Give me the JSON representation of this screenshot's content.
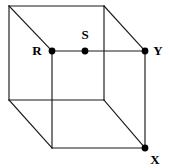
{
  "figure": {
    "type": "geometric-diagram",
    "shape": "cube",
    "background_color": "#ffffff",
    "line_color": "#1a1a1a",
    "point_color": "#000000",
    "canvas": {
      "width": 169,
      "height": 168
    }
  },
  "labels": {
    "r": "R",
    "s": "S",
    "y": "Y",
    "x": "X"
  },
  "points": [
    {
      "id": "r",
      "label": "R",
      "cx": 52,
      "cy": 51,
      "label_x": 37,
      "label_y": 52,
      "anchor": "middle"
    },
    {
      "id": "s",
      "label": "S",
      "cx": 85,
      "cy": 51,
      "label_x": 85,
      "label_y": 36,
      "anchor": "middle"
    },
    {
      "id": "y",
      "label": "Y",
      "cx": 145,
      "cy": 51,
      "label_x": 158,
      "label_y": 52,
      "anchor": "middle"
    },
    {
      "id": "x",
      "label": "X",
      "cx": 145,
      "cy": 148,
      "label_x": 155,
      "label_y": 161,
      "anchor": "middle"
    }
  ],
  "vertices": {
    "back_top_left": {
      "x": 9,
      "y": 6
    },
    "back_top_right": {
      "x": 104,
      "y": 6
    },
    "back_bottom_right": {
      "x": 104,
      "y": 100
    },
    "back_bottom_left": {
      "x": 9,
      "y": 100
    },
    "front_top_left": {
      "x": 52,
      "y": 51
    },
    "front_top_right": {
      "x": 145,
      "y": 51
    },
    "front_bottom_right": {
      "x": 145,
      "y": 148
    },
    "front_bottom_left": {
      "x": 52,
      "y": 148
    }
  },
  "edges": [
    {
      "name": "back-top",
      "x1": 9,
      "y1": 6,
      "x2": 104,
      "y2": 6
    },
    {
      "name": "back-right",
      "x1": 104,
      "y1": 6,
      "x2": 104,
      "y2": 100
    },
    {
      "name": "back-bottom",
      "x1": 9,
      "y1": 100,
      "x2": 104,
      "y2": 100
    },
    {
      "name": "back-left",
      "x1": 9,
      "y1": 6,
      "x2": 9,
      "y2": 100
    },
    {
      "name": "front-top",
      "x1": 52,
      "y1": 51,
      "x2": 145,
      "y2": 51
    },
    {
      "name": "front-right",
      "x1": 145,
      "y1": 51,
      "x2": 145,
      "y2": 148
    },
    {
      "name": "front-bottom",
      "x1": 52,
      "y1": 148,
      "x2": 145,
      "y2": 148
    },
    {
      "name": "front-left",
      "x1": 52,
      "y1": 51,
      "x2": 52,
      "y2": 148
    },
    {
      "name": "connector-top-left",
      "x1": 9,
      "y1": 6,
      "x2": 52,
      "y2": 51
    },
    {
      "name": "connector-top-right",
      "x1": 104,
      "y1": 6,
      "x2": 145,
      "y2": 51
    },
    {
      "name": "connector-bottom-right",
      "x1": 104,
      "y1": 100,
      "x2": 145,
      "y2": 148
    },
    {
      "name": "connector-bottom-left",
      "x1": 9,
      "y1": 100,
      "x2": 52,
      "y2": 148
    }
  ]
}
